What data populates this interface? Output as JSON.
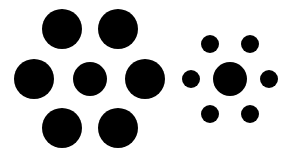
{
  "figure": {
    "title": "",
    "background": "#ffffff",
    "fill": "#000000",
    "groups": [
      {
        "name": "left-group",
        "center": {
          "cx": 90,
          "cy": 79,
          "r": 17
        },
        "surround": [
          {
            "cx": 62,
            "cy": 29,
            "r": 20
          },
          {
            "cx": 118,
            "cy": 29,
            "r": 20
          },
          {
            "cx": 34,
            "cy": 79,
            "r": 20
          },
          {
            "cx": 145,
            "cy": 79,
            "r": 20
          },
          {
            "cx": 62,
            "cy": 128,
            "r": 20
          },
          {
            "cx": 118,
            "cy": 128,
            "r": 20
          }
        ]
      },
      {
        "name": "right-group",
        "center": {
          "cx": 230,
          "cy": 79,
          "r": 17
        },
        "surround": [
          {
            "cx": 210,
            "cy": 44,
            "r": 9
          },
          {
            "cx": 250,
            "cy": 44,
            "r": 9
          },
          {
            "cx": 191,
            "cy": 79,
            "r": 9
          },
          {
            "cx": 269,
            "cy": 79,
            "r": 9
          },
          {
            "cx": 210,
            "cy": 114,
            "r": 9
          },
          {
            "cx": 250,
            "cy": 114,
            "r": 9
          }
        ]
      }
    ]
  }
}
